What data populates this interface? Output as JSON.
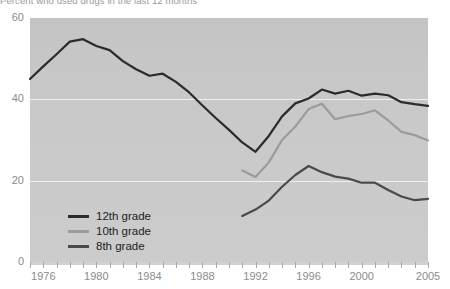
{
  "caption": "Percent who used drugs in the last 12 months",
  "colors": {
    "plot_background": "#c9c9c9",
    "gridline": "#f2f2f2",
    "axis_text": "#8b8b8b",
    "legend_text": "#1d1d1d",
    "grade12": "#2b2b2b",
    "grade10": "#9b9b9b",
    "grade8": "#4a4a4a"
  },
  "legend": {
    "position": "inside-bottom-left",
    "items": [
      {
        "label": "12th grade",
        "color": "#2b2b2b"
      },
      {
        "label": "10th grade",
        "color": "#9b9b9b"
      },
      {
        "label": "8th grade",
        "color": "#4a4a4a"
      }
    ]
  },
  "axes": {
    "y_ticks": [
      "0",
      "20",
      "40",
      "60"
    ],
    "x_ticks": [
      "1976",
      "1980",
      "1984",
      "1988",
      "1992",
      "1996",
      "2000",
      "2005"
    ]
  },
  "chart_data": {
    "type": "line",
    "title": "Percent who used drugs in the last 12 months",
    "xlabel": "",
    "ylabel": "",
    "xlim": [
      1975,
      2005
    ],
    "ylim": [
      0,
      60
    ],
    "grid": true,
    "gridlines_y": [
      20,
      40
    ],
    "legend_position": "inside-bottom-left",
    "x": [
      1975,
      1976,
      1977,
      1978,
      1979,
      1980,
      1981,
      1982,
      1983,
      1984,
      1985,
      1986,
      1987,
      1988,
      1989,
      1990,
      1991,
      1992,
      1993,
      1994,
      1995,
      1996,
      1997,
      1998,
      1999,
      2000,
      2001,
      2002,
      2003,
      2004,
      2005
    ],
    "series": [
      {
        "name": "12th grade",
        "color": "#2b2b2b",
        "x": [
          1975,
          1976,
          1977,
          1978,
          1979,
          1980,
          1981,
          1982,
          1983,
          1984,
          1985,
          1986,
          1987,
          1988,
          1989,
          1990,
          1991,
          1992,
          1993,
          1994,
          1995,
          1996,
          1997,
          1998,
          1999,
          2000,
          2001,
          2002,
          2003,
          2004,
          2005
        ],
        "values": [
          45.0,
          48.1,
          51.1,
          54.2,
          54.8,
          53.1,
          52.1,
          49.4,
          47.4,
          45.8,
          46.3,
          44.3,
          41.7,
          38.5,
          35.4,
          32.5,
          29.4,
          27.1,
          31.0,
          35.8,
          39.0,
          40.2,
          42.4,
          41.4,
          42.1,
          40.9,
          41.4,
          41.0,
          39.3,
          38.8,
          38.4
        ]
      },
      {
        "name": "10th grade",
        "color": "#9b9b9b",
        "x": [
          1991,
          1992,
          1993,
          1994,
          1995,
          1996,
          1997,
          1998,
          1999,
          2000,
          2001,
          2002,
          2003,
          2004,
          2005
        ],
        "values": [
          22.5,
          20.9,
          24.5,
          30.0,
          33.3,
          37.6,
          38.9,
          35.1,
          35.9,
          36.4,
          37.3,
          34.8,
          32.0,
          31.2,
          29.9
        ]
      },
      {
        "name": "8th grade",
        "color": "#4a4a4a",
        "x": [
          1991,
          1992,
          1993,
          1994,
          1995,
          1996,
          1997,
          1998,
          1999,
          2000,
          2001,
          2002,
          2003,
          2004,
          2005
        ],
        "values": [
          11.3,
          12.9,
          15.1,
          18.5,
          21.4,
          23.6,
          22.1,
          21.0,
          20.5,
          19.5,
          19.5,
          17.7,
          16.1,
          15.2,
          15.5
        ]
      }
    ]
  }
}
